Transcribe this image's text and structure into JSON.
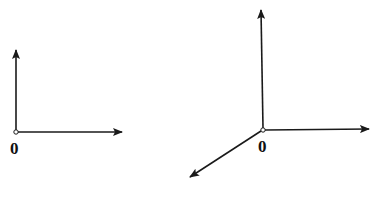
{
  "figures": [
    {
      "name": "2d-axes",
      "origin_label": "0",
      "origin": [
        16,
        132
      ],
      "axes": [
        {
          "name": "vertical-axis",
          "to": [
            16,
            50
          ]
        },
        {
          "name": "horizontal-axis",
          "to": [
            122,
            132
          ]
        }
      ]
    },
    {
      "name": "3d-axes",
      "origin_label": "0",
      "origin": [
        263,
        130
      ],
      "axes": [
        {
          "name": "vertical-axis",
          "to": [
            261,
            10
          ]
        },
        {
          "name": "horizontal-axis",
          "to": [
            369,
            129
          ]
        },
        {
          "name": "depth-axis",
          "to": [
            190,
            177
          ]
        }
      ]
    }
  ],
  "colors": {
    "stroke": "#1a1a1a",
    "background": "#ffffff"
  }
}
